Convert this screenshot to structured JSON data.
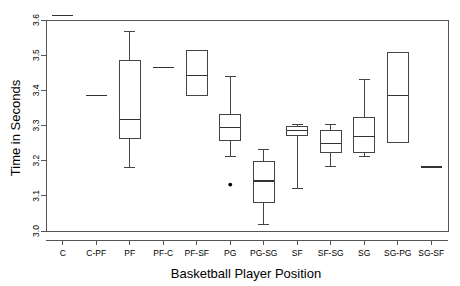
{
  "chart_data": {
    "type": "box",
    "title": "",
    "xlabel": "Basketball Player Position",
    "ylabel": "Time in Seconds",
    "ylim": [
      3.0,
      3.6
    ],
    "yticks": [
      3.0,
      3.1,
      3.2,
      3.3,
      3.4,
      3.5,
      3.6
    ],
    "ytick_labels": [
      "3.0",
      "3.1",
      "3.2",
      "3.3",
      "3.4",
      "3.5",
      "3.6"
    ],
    "grid": false,
    "legend": "none",
    "categories": [
      "C",
      "C-PF",
      "PF",
      "PF-C",
      "PF-SF",
      "PG",
      "PG-SG",
      "SF",
      "SF-SG",
      "SG",
      "SG-PG",
      "SG-SF"
    ],
    "boxes": [
      {
        "category": "C",
        "whisker_low": 3.612,
        "q1": 3.612,
        "median": 3.612,
        "q3": 3.612,
        "whisker_high": 3.612,
        "outliers": [],
        "degenerate": true
      },
      {
        "category": "C-PF",
        "whisker_low": 3.385,
        "q1": 3.385,
        "median": 3.385,
        "q3": 3.385,
        "whisker_high": 3.385,
        "outliers": [],
        "degenerate": true
      },
      {
        "category": "PF",
        "whisker_low": 3.18,
        "q1": 3.262,
        "median": 3.318,
        "q3": 3.485,
        "whisker_high": 3.568,
        "outliers": [],
        "degenerate": false
      },
      {
        "category": "PF-C",
        "whisker_low": 3.465,
        "q1": 3.465,
        "median": 3.465,
        "q3": 3.465,
        "whisker_high": 3.465,
        "outliers": [],
        "degenerate": true
      },
      {
        "category": "PF-SF",
        "whisker_low": 3.385,
        "q1": 3.385,
        "median": 3.442,
        "q3": 3.512,
        "whisker_high": 3.512,
        "outliers": [],
        "degenerate": false
      },
      {
        "category": "PG",
        "whisker_low": 3.212,
        "q1": 3.258,
        "median": 3.295,
        "q3": 3.332,
        "whisker_high": 3.438,
        "outliers": [
          3.132
        ],
        "degenerate": false
      },
      {
        "category": "PG-SG",
        "whisker_low": 3.018,
        "q1": 3.082,
        "median": 3.142,
        "q3": 3.198,
        "whisker_high": 3.232,
        "outliers": [],
        "degenerate": false
      },
      {
        "category": "SF",
        "whisker_low": 3.122,
        "q1": 3.272,
        "median": 3.285,
        "q3": 3.298,
        "whisker_high": 3.302,
        "outliers": [],
        "degenerate": false
      },
      {
        "category": "SF-SG",
        "whisker_low": 3.182,
        "q1": 3.222,
        "median": 3.248,
        "q3": 3.285,
        "whisker_high": 3.302,
        "outliers": [],
        "degenerate": false
      },
      {
        "category": "SG",
        "whisker_low": 3.212,
        "q1": 3.222,
        "median": 3.268,
        "q3": 3.322,
        "whisker_high": 3.432,
        "outliers": [],
        "degenerate": false
      },
      {
        "category": "SG-PG",
        "whisker_low": 3.252,
        "q1": 3.252,
        "median": 3.385,
        "q3": 3.508,
        "whisker_high": 3.508,
        "outliers": [],
        "degenerate": false
      },
      {
        "category": "SG-SF",
        "whisker_low": 3.182,
        "q1": 3.182,
        "median": 3.182,
        "q3": 3.182,
        "whisker_high": 3.182,
        "outliers": [],
        "degenerate": true
      }
    ]
  }
}
